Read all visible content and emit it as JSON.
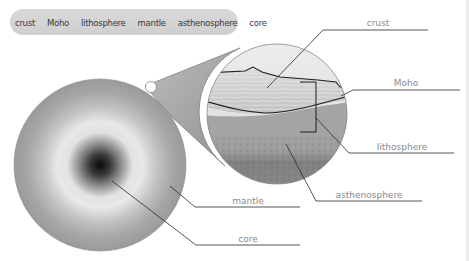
{
  "word_bank": {
    "items": [
      "crust",
      "Moho",
      "lithosphere",
      "mantle",
      "asthenosphere",
      "core"
    ]
  },
  "diagram": {
    "labels": {
      "crust": "crust",
      "moho": "Moho",
      "lithosphere": "lithosphere",
      "asthenosphere": "asthenosphere",
      "mantle": "mantle",
      "core": "core"
    }
  },
  "colors": {
    "label_text": "#8a8a8a",
    "leader_line": "#2a2a2a",
    "answer_line": "#555555",
    "word_bank_bg": "#d5d5d5"
  }
}
